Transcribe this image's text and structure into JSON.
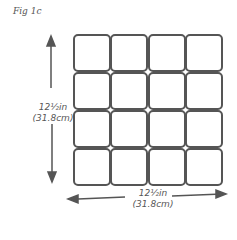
{
  "figure": {
    "label": "Fig 1c",
    "grid": {
      "rows": 4,
      "cols": 4,
      "x": 73,
      "y": 34,
      "width": 150,
      "height": 151,
      "stroke": "#555555"
    },
    "vertical_dimension": {
      "line1": "12½in",
      "line2": "(31.8cm)"
    },
    "horizontal_dimension": {
      "line1": "12½in",
      "line2": "(31.8cm)"
    },
    "arrow_color": "#555555"
  }
}
